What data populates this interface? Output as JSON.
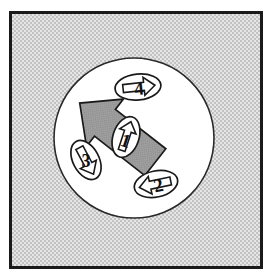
{
  "figure": {
    "frame": {
      "name": "outer-frame",
      "x": 9,
      "y": 11,
      "width": 254,
      "height": 258,
      "border_color": "#1a1a1a",
      "border_width": 3,
      "fill_color": "#d8d8d8",
      "fill_pattern": "halftone-dither"
    },
    "field_circle": {
      "name": "field-circle",
      "cx": 134,
      "cy": 138,
      "r": 80,
      "fill_color": "#ffffff",
      "stroke_color": "#1a1a1a",
      "stroke_width": 1.6
    },
    "motion_arrow": {
      "label": "bulk-motion-arrow",
      "direction": "up-right",
      "angle_deg": 52,
      "fill_color": "#9a9a9a",
      "stroke_color": "#1a1a1a"
    },
    "bodies": [
      {
        "id": "body-1",
        "number": "1",
        "cx": 126,
        "cy": 137,
        "rx": 13,
        "ry": 21,
        "rotation_deg": 18,
        "arrow_direction": "up",
        "arrow_fill": "#ffffff",
        "body_fill": "#ffffff",
        "stroke_color": "#1a1a1a"
      },
      {
        "id": "body-2",
        "number": "2",
        "cx": 156,
        "cy": 184,
        "rx": 22,
        "ry": 13,
        "rotation_deg": -12,
        "arrow_direction": "left",
        "arrow_fill": "#ffffff",
        "body_fill": "#ffffff",
        "stroke_color": "#1a1a1a"
      },
      {
        "id": "body-3",
        "number": "3",
        "cx": 86,
        "cy": 160,
        "rx": 21,
        "ry": 13,
        "rotation_deg": 62,
        "arrow_direction": "up-right",
        "arrow_fill": "#ffffff",
        "body_fill": "#ffffff",
        "stroke_color": "#1a1a1a"
      },
      {
        "id": "body-4",
        "number": "4",
        "cx": 138,
        "cy": 87,
        "rx": 23,
        "ry": 13,
        "rotation_deg": -6,
        "arrow_direction": "right",
        "arrow_fill": "#ffffff",
        "body_fill": "#ffffff",
        "stroke_color": "#1a1a1a"
      }
    ],
    "colors": {
      "ink": "#1a1a1a",
      "background_gray": "#d8d8d8",
      "arrow_gray": "#9a9a9a",
      "white": "#ffffff",
      "page": "#ffffff"
    }
  }
}
